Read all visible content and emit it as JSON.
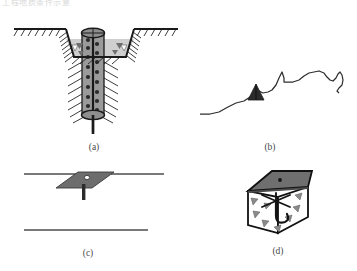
{
  "figure": {
    "header_partial_text": "工程地质条件示意",
    "background_color": "#ffffff",
    "width": 357,
    "height": 271,
    "panel_count": 4
  },
  "palette": {
    "line_dark": "#1a1a1a",
    "fill_gray": "#8e8e8e",
    "fill_gray_light": "#c9c9c9",
    "fill_gray_mid": "#9a9a9a",
    "top_face_gray": "#7d7d7d",
    "white": "#ffffff",
    "caption_color": "#4a4a4a"
  },
  "panels": [
    {
      "id": "a",
      "caption": "(a)",
      "title": "excavation-cross-section-with-stone-column",
      "elements": {
        "ground_surface": "hatched ground line",
        "excavation": "trapezoidal trench with hatched sloping walls",
        "fill_material": "gray triangular backfill symbols",
        "column": "vertical gray cylinder with dark aggregate dots",
        "column_cap": "elliptical top cap with cross lines",
        "column_base": "elliptical bottom cap",
        "stem": "vertical rod extending below base"
      }
    },
    {
      "id": "b",
      "caption": "(b)",
      "title": "terrain-profile-with-cone",
      "elements": {
        "profile_line": "irregular jagged terrain silhouette",
        "cone": "small dark triangular cone on slope"
      }
    },
    {
      "id": "c",
      "caption": "(c)",
      "title": "perspective-plate-with-hole-and-stem",
      "elements": {
        "upper_line": "horizontal reference line",
        "plate": "dark gray parallelogram plate in perspective",
        "hole": "small white circular hole in plate",
        "stem": "short vertical rod below plate",
        "lower_line": "horizontal reference line"
      }
    },
    {
      "id": "d",
      "caption": "(d)",
      "title": "three-dimensional-box-with-gravel-and-anchor",
      "elements": {
        "box": "open-top cuboid drawn in perspective",
        "top_face": "dark gray shaded lid with center dot",
        "gravel": "gray triangular aggregate symbols",
        "anchor": "dark hook / anchor radiating spokes"
      }
    }
  ],
  "captions": {
    "a": "(a)",
    "b": "(b)",
    "c": "(c)",
    "d": "(d)"
  }
}
